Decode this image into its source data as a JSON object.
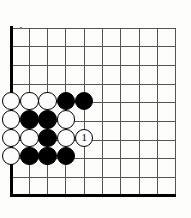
{
  "diagram": {
    "kind": "go-board-problem-diagram",
    "board": {
      "visible_columns": 10,
      "visible_rows": 10,
      "origin_corner": "bottom-left",
      "grid_spacing_px": 18.3,
      "left_edge_x": 11,
      "top_edge_y": 28,
      "bottom_edge_y": 196,
      "right_line_x": 176,
      "line_color": "#555555",
      "edge_color": "#000000",
      "background_color": "#fdfdfc",
      "star_point": {
        "col": 0.55,
        "row": 0,
        "visible": true
      }
    },
    "stones": [
      {
        "id": "w-a",
        "color": "white",
        "col": 0,
        "row": 4,
        "label": ""
      },
      {
        "id": "w-b",
        "color": "white",
        "col": 1,
        "row": 4,
        "label": ""
      },
      {
        "id": "w-c",
        "color": "white",
        "col": 2,
        "row": 4,
        "label": ""
      },
      {
        "id": "b-a",
        "color": "black",
        "col": 3,
        "row": 4,
        "label": ""
      },
      {
        "id": "b-b",
        "color": "black",
        "col": 4,
        "row": 4,
        "label": ""
      },
      {
        "id": "w-d",
        "color": "white",
        "col": 0,
        "row": 5,
        "label": ""
      },
      {
        "id": "b-c",
        "color": "black",
        "col": 1,
        "row": 5,
        "label": ""
      },
      {
        "id": "b-d",
        "color": "black",
        "col": 2,
        "row": 5,
        "label": ""
      },
      {
        "id": "w-e",
        "color": "white",
        "col": 3,
        "row": 5,
        "label": ""
      },
      {
        "id": "w-f",
        "color": "white",
        "col": 0,
        "row": 6,
        "label": ""
      },
      {
        "id": "w-g",
        "color": "white",
        "col": 1,
        "row": 6,
        "label": ""
      },
      {
        "id": "b-e",
        "color": "black",
        "col": 2,
        "row": 6,
        "label": ""
      },
      {
        "id": "w-h",
        "color": "white",
        "col": 3,
        "row": 6,
        "label": ""
      },
      {
        "id": "move-1",
        "color": "white",
        "col": 4,
        "row": 6,
        "label": "1"
      },
      {
        "id": "w-i",
        "color": "white",
        "col": 0,
        "row": 7,
        "label": ""
      },
      {
        "id": "b-f",
        "color": "black",
        "col": 1,
        "row": 7,
        "label": ""
      },
      {
        "id": "b-g",
        "color": "black",
        "col": 2,
        "row": 7,
        "label": ""
      },
      {
        "id": "b-h",
        "color": "black",
        "col": 3,
        "row": 7,
        "label": ""
      }
    ],
    "move_numbers": [
      "1"
    ],
    "colors": {
      "black_stone": "#000000",
      "white_stone": "#fdfdfd",
      "stone_outline": "#000000",
      "grid_line": "#555555",
      "board_edge": "#000000"
    }
  }
}
